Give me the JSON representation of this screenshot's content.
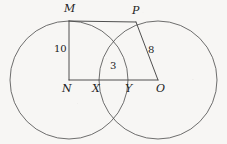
{
  "figure": {
    "type": "geometry-diagram",
    "background_color": "#f7f6f4",
    "stroke_color": "#4a4a4a",
    "canvas": {
      "width": 227,
      "height": 144
    },
    "circles": [
      {
        "name": "left-circle",
        "center_label": "N",
        "cx": 69,
        "cy": 80,
        "r": 59
      },
      {
        "name": "right-circle",
        "center_label": "O",
        "cx": 158,
        "cy": 80,
        "r": 59
      }
    ],
    "points": [
      {
        "label": "M",
        "x": 69,
        "y": 21,
        "label_x": 64,
        "label_y": 3
      },
      {
        "label": "P",
        "x": 136,
        "y": 22,
        "label_x": 132,
        "label_y": 5
      },
      {
        "label": "N",
        "x": 69,
        "y": 80,
        "label_x": 62,
        "label_y": 83
      },
      {
        "label": "X",
        "x": 98,
        "y": 80,
        "label_x": 92,
        "label_y": 83
      },
      {
        "label": "Y",
        "x": 130,
        "y": 80,
        "label_x": 125,
        "label_y": 83
      },
      {
        "label": "O",
        "x": 158,
        "y": 80,
        "label_x": 156,
        "label_y": 83
      }
    ],
    "segments": [
      {
        "name": "segment-MN",
        "from": "M",
        "to": "N",
        "length_label": "10"
      },
      {
        "name": "segment-MP",
        "from": "M",
        "to": "P",
        "length_label": ""
      },
      {
        "name": "segment-PO",
        "from": "P",
        "to": "O",
        "length_label": "8"
      },
      {
        "name": "segment-NO",
        "from": "N",
        "to": "O",
        "length_label": ""
      }
    ],
    "measure_labels": [
      {
        "name": "length-10",
        "text": "10",
        "x": 54,
        "y": 44
      },
      {
        "name": "length-8",
        "text": "8",
        "x": 148,
        "y": 45
      },
      {
        "name": "length-3",
        "text": "3",
        "x": 110,
        "y": 61
      }
    ],
    "lens": {
      "name": "overlap-lens",
      "left_x": 98,
      "right_x": 130,
      "top_y": 28,
      "bottom_y": 132
    }
  }
}
